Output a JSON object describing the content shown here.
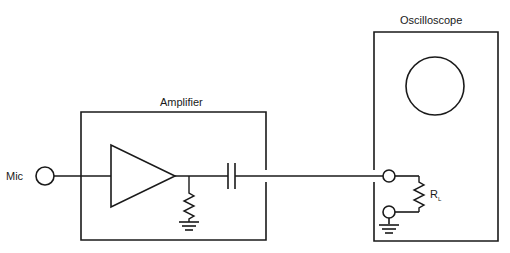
{
  "diagram": {
    "type": "circuit",
    "labels": {
      "mic": "Mic",
      "amplifier": "Amplifier",
      "oscilloscope": "Oscilloscope",
      "load_resistor": "R",
      "load_resistor_subscript": "L"
    },
    "components": [
      {
        "id": "mic",
        "kind": "input-terminal"
      },
      {
        "id": "amplifier",
        "kind": "box",
        "contains": [
          "op-amp-triangle",
          "shunt-resistor",
          "ground",
          "coupling-capacitor"
        ]
      },
      {
        "id": "oscilloscope",
        "kind": "box",
        "contains": [
          "screen",
          "input-terminal",
          "ground-terminal",
          "load-resistor",
          "ground"
        ]
      }
    ],
    "colors": {
      "stroke": "#1a1a1a",
      "background": "#ffffff"
    }
  }
}
